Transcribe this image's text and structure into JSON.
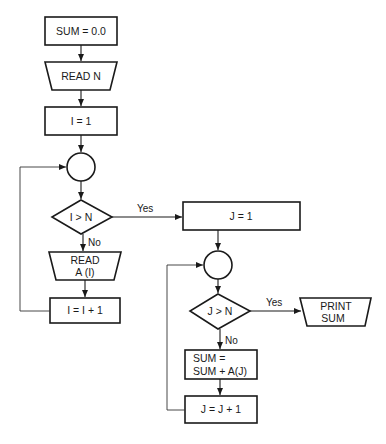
{
  "flowchart": {
    "nodes": {
      "init_sum": {
        "type": "process",
        "text": "SUM = 0.0"
      },
      "read_n": {
        "type": "input",
        "text": "READ N"
      },
      "init_i": {
        "type": "process",
        "text": "I = 1"
      },
      "connector_1": {
        "type": "connector",
        "text": ""
      },
      "decision_i": {
        "type": "decision",
        "text": "I > N"
      },
      "read_a": {
        "type": "input",
        "line1": "READ",
        "line2": "A (I)"
      },
      "incr_i": {
        "type": "process",
        "text": "I = I + 1"
      },
      "init_j": {
        "type": "process",
        "text": "J = 1"
      },
      "connector_2": {
        "type": "connector",
        "text": ""
      },
      "decision_j": {
        "type": "decision",
        "text": "J > N"
      },
      "print_sum": {
        "type": "output",
        "line1": "PRINT",
        "line2": "SUM"
      },
      "accumulate": {
        "type": "process",
        "line1": "SUM =",
        "line2": "SUM + A(J)"
      },
      "incr_j": {
        "type": "process",
        "text": "J = J + 1"
      }
    },
    "edges": {
      "i_yes": "Yes",
      "i_no": "No",
      "j_yes": "Yes",
      "j_no": "No"
    }
  }
}
